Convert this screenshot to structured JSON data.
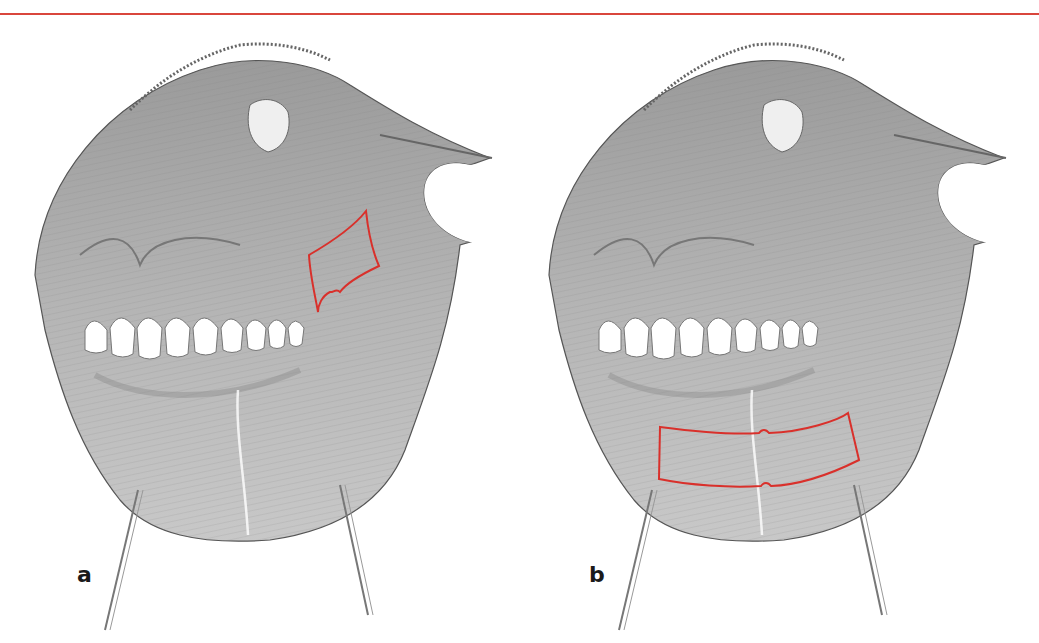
{
  "figure": {
    "top_rule_color": "#d9463c",
    "highlight_color": "#d9302b",
    "panels": [
      {
        "label": "a",
        "highlight": "buccal-mucosa-quadrilateral"
      },
      {
        "label": "b",
        "highlight": "lower-lip-mucosa-band"
      }
    ]
  }
}
